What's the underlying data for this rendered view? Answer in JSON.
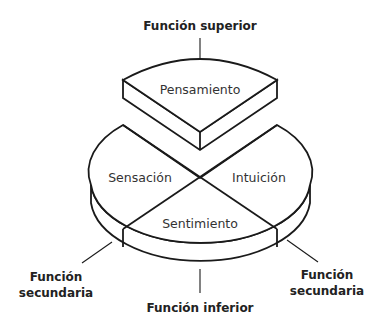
{
  "diagram": {
    "type": "jung-psychological-functions",
    "segments": {
      "top": "Pensamiento",
      "left": "Sensación",
      "right": "Intuición",
      "bottom": "Sentimiento"
    },
    "function_labels": {
      "superior": "Función superior",
      "secondary_left_line1": "Función",
      "secondary_left_line2": "secundaria",
      "secondary_right_line1": "Función",
      "secondary_right_line2": "secundaria",
      "inferior": "Función inferior"
    },
    "colors": {
      "stroke": "#1a1a1a",
      "background": "#ffffff",
      "text": "#333333"
    }
  }
}
